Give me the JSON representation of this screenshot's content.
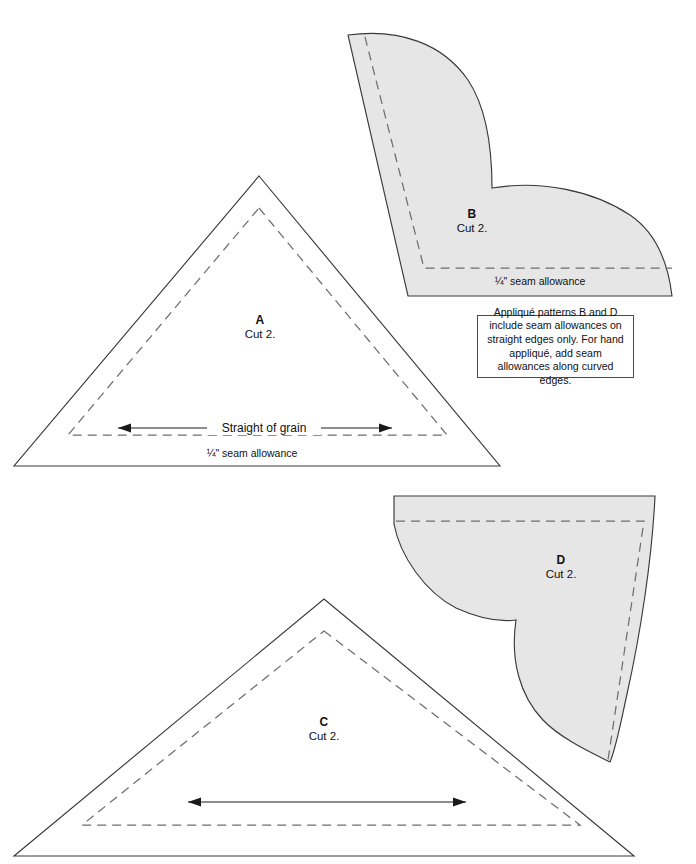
{
  "sheet": {
    "title": "Quilt appliqué pattern template sheet",
    "width": 696,
    "height": 864,
    "background_color": "#ffffff"
  },
  "style": {
    "cut_line_color": "#3a3a3a",
    "seam_line_color": "#6e6e6e",
    "applique_fill_color": "#e6e6e6",
    "text_color": "#111111"
  },
  "pieces": [
    {
      "id": "A",
      "letter": "A",
      "cut_label": "Cut 2.",
      "shape": "triangle",
      "filled": false,
      "seam_note": "¼\" seam allowance",
      "grainline_label": "Straight of grain",
      "has_grainline": true
    },
    {
      "id": "B",
      "letter": "B",
      "cut_label": "Cut 2.",
      "shape": "applique-curve",
      "filled": true,
      "seam_note": "¼\" seam allowance",
      "grainline_label": "",
      "has_grainline": false
    },
    {
      "id": "C",
      "letter": "C",
      "cut_label": "Cut 2.",
      "shape": "triangle",
      "filled": false,
      "seam_note": "",
      "grainline_label": "",
      "has_grainline": true
    },
    {
      "id": "D",
      "letter": "D",
      "cut_label": "Cut 2.",
      "shape": "applique-curve",
      "filled": true,
      "seam_note": "",
      "grainline_label": "",
      "has_grainline": false
    }
  ],
  "info_box": {
    "text": "Appliqué patterns B and D include seam allowances on straight edges only. For hand appliqué, add seam allowances along curved edges."
  }
}
